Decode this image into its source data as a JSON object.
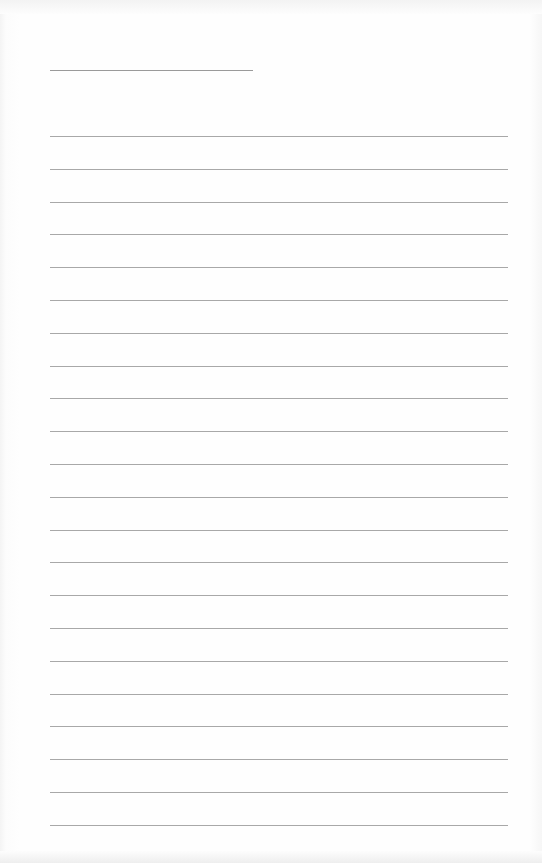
{
  "document": {
    "type": "blank lined paper",
    "name_line": {
      "x": 50,
      "y": 70,
      "width": 203
    },
    "rules": {
      "count": 22,
      "first_y": 136,
      "spacing": 32.8,
      "x": 50,
      "width": 458,
      "color": "#a8a8a8"
    }
  }
}
